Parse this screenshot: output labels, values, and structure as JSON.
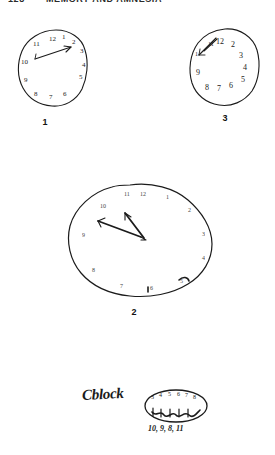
{
  "page": {
    "header": {
      "page_number": "128",
      "running_title": "MEMORY AND AMNESIA"
    },
    "background_color": "#ffffff",
    "ink_color": "#1b1b1b"
  },
  "figures": [
    {
      "id": "clock-1",
      "label": "1",
      "description": "small hand-drawn clock face, slightly lumpy circle, numbers 1-12 around the rim, one long hand drawn as an arrow pointing toward the 2 o'clock position",
      "numbers": [
        "12",
        "1",
        "2",
        "3",
        "4",
        "5",
        "6",
        "7",
        "8",
        "9",
        "10",
        "11"
      ],
      "hands": [
        {
          "name": "arrow-hand",
          "points_to": "2",
          "style": "arrow"
        }
      ]
    },
    {
      "id": "clock-2",
      "label": "2",
      "description": "large irregular hand-drawn clock outline with faint tick-like numerals; two heavy hands meeting near the centre pointing up-left and up",
      "numbers": [
        "12",
        "11",
        "10",
        "9",
        "8",
        "7",
        "6",
        "5",
        "4",
        "3",
        "2",
        "1"
      ],
      "hands": [
        {
          "name": "long-hand",
          "points_to": "10",
          "style": "arrow"
        },
        {
          "name": "short-hand",
          "points_to": "12",
          "style": "arrow"
        }
      ]
    },
    {
      "id": "clock-3",
      "label": "3",
      "description": "small hand-drawn clock; numbers 10, 11, 12 crowded together at the upper left with hand strokes among them, remaining numbers 1-9 spread clockwise",
      "numbers": [
        "12",
        "1",
        "2",
        "3",
        "4",
        "5",
        "6",
        "7",
        "8",
        "9",
        "10",
        "11"
      ],
      "hands": [
        {
          "name": "crowded-hands",
          "points_to": "11",
          "style": "scribble"
        }
      ]
    }
  ],
  "annotations": {
    "word": "Cblock",
    "oval_numbers": "3 4 5 6 7 8",
    "oval_scribble": "12 11 10 9",
    "below_oval": "10, 9, 8, 11"
  }
}
